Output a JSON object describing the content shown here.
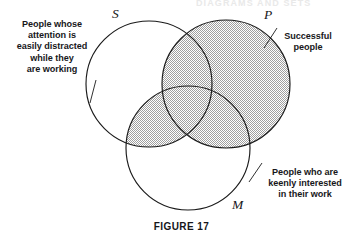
{
  "figure": {
    "caption": "FIGURE 17",
    "cut_off_header": "DIAGRAMS AND SETS",
    "background_color": "#ffffff",
    "stroke_color": "#1a1a1a",
    "shade_color": "#c9c9c9"
  },
  "sets": [
    {
      "id": "S",
      "letter": "S",
      "label": "People whose\nattention  is\neasily distracted\nwhile they\nare working",
      "label_position": "left",
      "center": [
        149,
        84
      ],
      "radius": 63
    },
    {
      "id": "P",
      "letter": "P",
      "label": "Successful\npeople",
      "label_position": "right-top",
      "center": [
        226,
        84
      ],
      "radius": 64
    },
    {
      "id": "M",
      "letter": "M",
      "label": "People who are\nkeenly interested\nin their work",
      "label_position": "right-bottom",
      "center": [
        188,
        148
      ],
      "radius": 62
    }
  ],
  "shading": {
    "description": "P union (S intersect M)",
    "pattern": "halftone-dots",
    "regions": [
      "P",
      "S-and-M"
    ]
  }
}
